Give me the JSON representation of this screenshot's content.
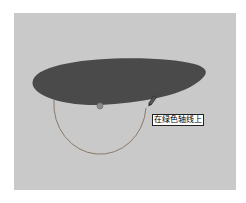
{
  "canvas": {
    "background": "#c9c9c9",
    "ellipse_fill": "#4a4a4a",
    "arc_color": "#8a7a6a",
    "center_point_color": "#8a8a8a"
  },
  "tooltip": {
    "text": "在绿色轴线上"
  },
  "cursor": {
    "icon": "pencil-icon"
  }
}
